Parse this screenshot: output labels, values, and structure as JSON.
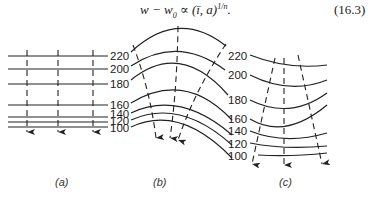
{
  "equation": {
    "lhs": "w − w",
    "sub": "0",
    "rhs": " ∝ (ī, a)",
    "exponent": "1/n",
    "end": ".",
    "number": "(16.3)"
  },
  "panels": [
    {
      "id": "a",
      "caption": "(a)"
    },
    {
      "id": "b",
      "caption": "(b)"
    },
    {
      "id": "c",
      "caption": "(c)"
    }
  ],
  "contour_labels": {
    "ab": [
      "220",
      "200",
      "180",
      "160",
      "140",
      "120",
      "100"
    ],
    "c": [
      "220",
      "200",
      "180",
      "160",
      "140",
      "120",
      "100"
    ]
  }
}
